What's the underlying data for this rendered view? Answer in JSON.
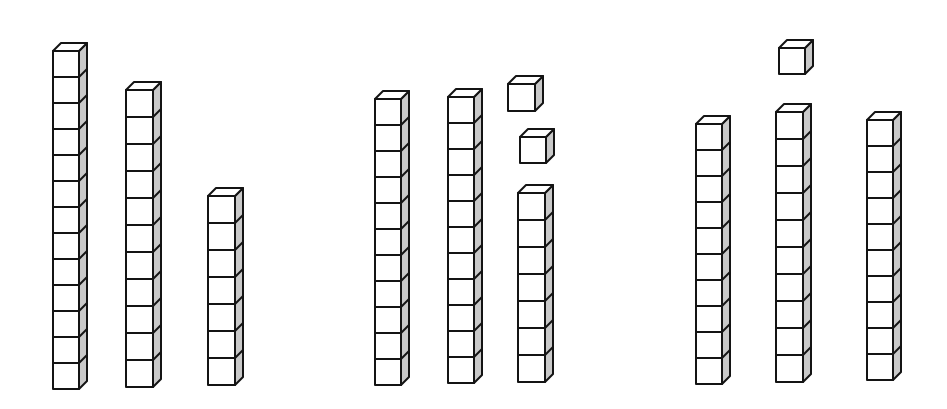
{
  "diagram": {
    "type": "unit-cube-towers",
    "style": {
      "stroke": "#141414",
      "front_fill": "#ffffff",
      "top_fill": "#ffffff",
      "side_fill": "#c9c9c9",
      "stroke_width": 2,
      "depth_x": 8,
      "depth_y": 8
    },
    "groups": [
      {
        "name": "group-1",
        "total_cubes": 31,
        "towers": [
          {
            "x": 53,
            "bottom": 389,
            "width": 26,
            "cubes": 13
          },
          {
            "x": 126,
            "bottom": 387,
            "width": 27,
            "cubes": 11
          },
          {
            "x": 208,
            "bottom": 385,
            "width": 27,
            "cubes": 7
          }
        ],
        "loose_cubes": []
      },
      {
        "name": "group-2",
        "total_cubes": 31,
        "towers": [
          {
            "x": 375,
            "bottom": 385,
            "width": 26,
            "cubes": 11
          },
          {
            "x": 448,
            "bottom": 383,
            "width": 26,
            "cubes": 11
          },
          {
            "x": 518,
            "bottom": 382,
            "width": 27,
            "cubes": 7
          }
        ],
        "loose_cubes": [
          {
            "x": 508,
            "bottom": 111,
            "width": 27
          },
          {
            "x": 520,
            "bottom": 163,
            "width": 26
          }
        ]
      },
      {
        "name": "group-3",
        "total_cubes": 31,
        "towers": [
          {
            "x": 696,
            "bottom": 384,
            "width": 26,
            "cubes": 10
          },
          {
            "x": 776,
            "bottom": 382,
            "width": 27,
            "cubes": 10
          },
          {
            "x": 867,
            "bottom": 380,
            "width": 26,
            "cubes": 10
          }
        ],
        "loose_cubes": [
          {
            "x": 779,
            "bottom": 74,
            "width": 26
          }
        ]
      }
    ]
  }
}
